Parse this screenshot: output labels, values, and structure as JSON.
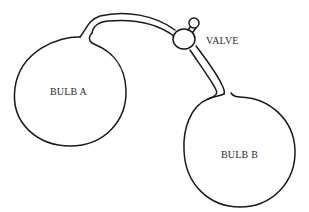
{
  "diagram": {
    "title": "",
    "labels": {
      "valve": "VALVE",
      "bulb_a": "BULB A",
      "bulb_b": "BULB B"
    },
    "components": [
      {
        "id": "bulb_a",
        "type": "bulb",
        "label": "BULB A"
      },
      {
        "id": "bulb_b",
        "type": "bulb",
        "label": "BULB B"
      },
      {
        "id": "tube",
        "type": "connecting-tube",
        "connects": [
          "bulb_a",
          "bulb_b"
        ]
      },
      {
        "id": "valve",
        "type": "valve",
        "label": "VALVE",
        "location": "on tube between bulbs"
      }
    ],
    "colors": {
      "line": "#1a1a1a",
      "text": "#2a2a2a",
      "background": "#ffffff"
    }
  }
}
